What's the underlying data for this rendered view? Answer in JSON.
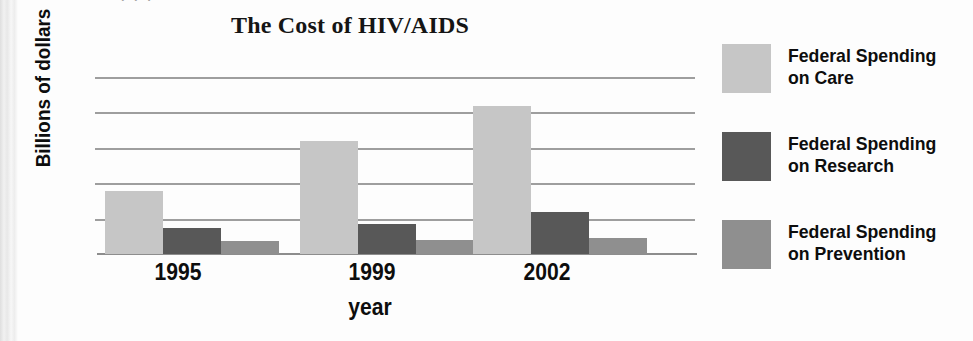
{
  "chart_data": {
    "type": "bar",
    "title": "The Cost of HIV/AIDS",
    "xlabel": "year",
    "ylabel": "Billions of dollars",
    "categories": [
      "1995",
      "1999",
      "2002"
    ],
    "ylim": [
      0,
      10
    ],
    "yticks": [
      "0",
      "2",
      "4",
      "6",
      "8",
      "10"
    ],
    "ytick_values": [
      0,
      2,
      4,
      6,
      8,
      10
    ],
    "grid": true,
    "legend_position": "right",
    "series": [
      {
        "name": "Federal Spending on Care",
        "label_line1": "Federal Spending",
        "label_line2": "on Care",
        "color": "#c6c6c6",
        "values": [
          3.6,
          6.4,
          8.4
        ]
      },
      {
        "name": "Federal Spending on Research",
        "label_line1": "Federal Spending",
        "label_line2": "on Research",
        "color": "#585858",
        "values": [
          1.5,
          1.7,
          2.4
        ]
      },
      {
        "name": "Federal Spending on Prevention",
        "label_line1": "Federal Spending",
        "label_line2": "on Prevention",
        "color": "#8f8f8f",
        "values": [
          0.75,
          0.8,
          0.9
        ]
      }
    ]
  },
  "scan_artifact": {
    "top_clipped_text": "· · ·"
  }
}
